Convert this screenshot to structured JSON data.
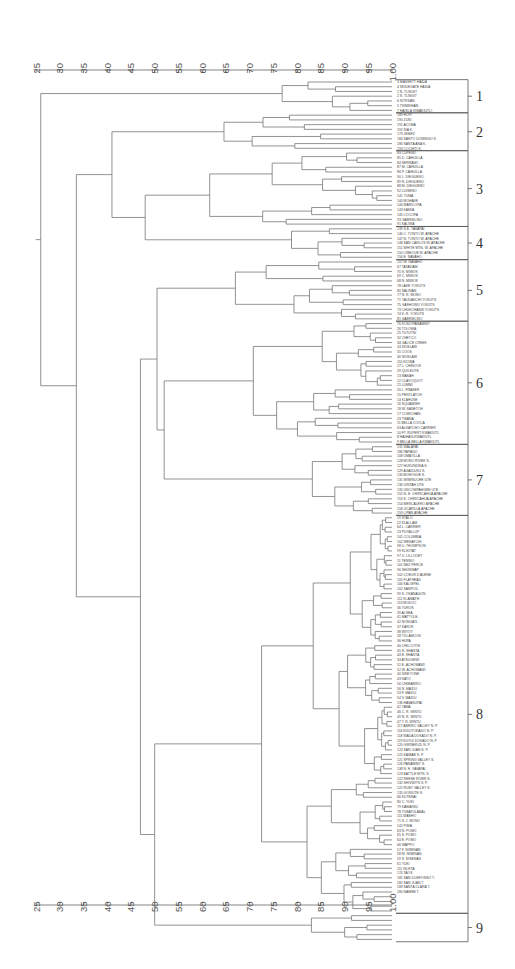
{
  "chart_data": {
    "type": "dendrogram",
    "orientation": "horizontal",
    "title": "",
    "xlabel": "",
    "ylabel": "",
    "axis": {
      "ticks": [
        25,
        30,
        35,
        40,
        45,
        50,
        55,
        60,
        65,
        70,
        75,
        80,
        85,
        90,
        95,
        100
      ],
      "tick_labels": [
        "25",
        "30",
        "35",
        "40",
        "45",
        "50",
        "55",
        "60",
        "65",
        "70",
        "75",
        "80",
        "85",
        "90",
        "95",
        "1.00"
      ],
      "range": [
        25,
        100
      ],
      "positions": [
        "top",
        "bottom"
      ]
    },
    "clusters": [
      {
        "id": "1",
        "label": "1",
        "leaf_range": [
          0,
          6
        ]
      },
      {
        "id": "2",
        "label": "2",
        "leaf_range": [
          7,
          14
        ]
      },
      {
        "id": "3",
        "label": "3",
        "leaf_range": [
          15,
          30
        ]
      },
      {
        "id": "4",
        "label": "4",
        "leaf_range": [
          31,
          37
        ]
      },
      {
        "id": "5",
        "label": "5",
        "leaf_range": [
          38,
          50
        ]
      },
      {
        "id": "6",
        "label": "6",
        "leaf_range": [
          51,
          76
        ]
      },
      {
        "id": "7",
        "label": "7",
        "leaf_range": [
          77,
          91
        ]
      },
      {
        "id": "8",
        "label": "8",
        "leaf_range": [
          92,
          175
        ]
      },
      {
        "id": "9",
        "label": "9",
        "leaf_range": [
          176,
          181
        ]
      }
    ],
    "leaves": [
      "3 MASSETT HAIDA",
      "4 SKIDEGATE HAIDA",
      "1 N. TLINGIT",
      "2 S. TLINGIT",
      "6 SITKSAN",
      "5 TSIMSHIAN",
      "7 HAISLA (KWAKIUTL)",
      "189 HOPI",
      "190 ZUNI",
      "191 ACOMA",
      "192 SIA K.",
      "173 JEMEZ",
      "184 SANTO DOMINGO K.",
      "186 SANTA ANA K.",
      "193 COCHITI K.",
      "83 CUPENO",
      "85 D. CAHUILLA",
      "84 SERRANO",
      "87 M. CAHUILLA",
      "86 P. CAHUILLA",
      "90 L. DIEGUENO",
      "89 N. DIEGUENO",
      "88 M. DIEGUENO",
      "92 LUISENO",
      "141 YUMA",
      "140 MOHAVE",
      "144 MARICOPA",
      "143 KAMIA",
      "145 COCOPA",
      "93 GABRIELINO",
      "91 KALIWA",
      "139 S.E. YAVAPAI",
      "146 C. TONTO W. APACHE",
      "147 N. TONTO W. APACHE",
      "148 SAN CARLOS W. APACHE",
      "151 WHITE MTN. W. APACHE",
      "150 CIBECUE W. APACHE",
      "156 E. NAVAHO",
      "157 W. NAVAHO",
      "67 TATAVIAM",
      "70 S. MIWOK",
      "69 C. MIWOK",
      "68 N. MIWOK",
      "78 LAKE YOKUTS",
      "80 SALINAN",
      "77 N. R. MONO",
      "71 YAUDANCHI YOKUTS",
      "75 GASHOWU YOKUTS",
      "73 CHUKCHANSI YOKUTS",
      "74 K. R. YOKUTS",
      "81 GABRIELINO",
      "76 KOSO/PANAMINT",
      "26 TOLOWA",
      "25 TUTUTNI",
      "32 CHETCO",
      "34 GALICE CREEK",
      "24 SIUSLAW",
      "31 COOS",
      "30 SIUSLAW",
      "110 KIOWA",
      "27 L. CHINOOK",
      "29 QUILEUTE",
      "13 MAKAH",
      "12 CLAYOQUOT",
      "21 LUMMI",
      "20 L. FRASER",
      "15 PENTLATCH",
      "14 KLAHUSE",
      "16 SQUAMISH",
      "18 W. SANETCH",
      "17 COWICHAN",
      "23 TWANA",
      "11 BELLA COOLA",
      "63 ALKATCHO CARRIER",
      "10 FT. RUPERT KWAKIUTL",
      "8 HAIHAIS KWAKIUTL",
      "9 BELLA BELLA KWAKIUTL",
      "131 WALAPAI",
      "186 PAPAGO",
      "108 UMATILLA",
      "128 MONO RIVER S.",
      "127 HUKUNDIKA S.",
      "129 AGAIDUKU S.",
      "130 BOHOGUE S.",
      "131 WIMINUCHE UTE",
      "136 UINTAH UTE",
      "135 UNCOMPAHGRE UTE",
      "152 N. E. CHIRICAHUA APACHE",
      "153 S. CHIRICAHUA APACHE",
      "154 MESCALERO APACHE",
      "158 JICARILLA APACHE",
      "159 LIPAN APACHE",
      "19 STALO",
      "22 KLALLAM",
      "64 L. CARRIER",
      "23 PUYALLUP",
      "101 COLUMBIA",
      "102 WENATCHI",
      "98 U. THOMPSON",
      "99 KLIKITAT",
      "97 U. LILLOOET",
      "11 TENINO",
      "101 NEZ PERCE",
      "96 SHUSWAP",
      "102 COEUR D'ALENE",
      "105 FLATHEAD",
      "106 KALISPEL",
      "102 SANPOIL",
      "99 S. OKANAGON",
      "112 KLAMATH",
      "113 MODOC",
      "36 YUROK",
      "39 ALSEA",
      "41 MATTOLE",
      "42 NONGATL",
      "37 KAROK",
      "38 WIYOT",
      "28 TILLAMOOK",
      "36 HUPA",
      "40 CHILCOTIN",
      "45 N. SHASTA",
      "44 E. SHASTA",
      "33 ATSUGEWI",
      "51 E. ACHOMAWI",
      "52 W. ACHOMAWI",
      "40 SINKYONE",
      "43 KATO",
      "56 CHIMARIKO",
      "56 N. MAIDU",
      "53 F. MAIDU",
      "54 V. MAIDU",
      "136 HAVASUPAI",
      "62 YANA",
      "46 C. R. WINTU",
      "49 N. R. WINTU",
      "47 T. R. WINTU",
      "117 AMERIC VALLEY N. P.",
      "116 KIDUTOKADO N. P.",
      "118 WADA DOKADO N. P.",
      "119 KUYUI DOKADO N. P.",
      "120 GWINEKUD N. P.",
      "124 SAN JUAN S. P.",
      "125 KAIBAB S. P.",
      "121 SPRING VALLEY S.",
      "126 PANAMINT S.",
      "138 N. E. YAVAPAI",
      "123 BATTLE MTN. S.",
      "122 REESE RIVER S.",
      "132 SHIVWITS S. P.",
      "122 RUBY VALLEY S.",
      "135 GOSIUTE S.",
      "66 KUTENAI",
      "80 C. YUKI",
      "79 KAWAIISU",
      "78 TUBATULABAL",
      "115 WASHO",
      "71 S. J. MONO",
      "142 PIMA",
      "63 N. POMO",
      "65 S. POMO",
      "64 E. POMO",
      "66 WAPPO",
      "57 F. NISENAN",
      "58 M. NISENAN",
      "59 S. NISENAN",
      "61 YUKI",
      "111 ISLETA",
      "170 TAOS",
      "181 SAN ILDEFONSO T.",
      "182 SAN JUAN T.",
      "183 SANTA CLARA T.",
      "180 NAMBE T."
    ],
    "merges_note": "Tree encoded as nested [left, right, similarity]; integers are leaf indices.",
    "tree": [
      [
        [
          [
            [
              [
                0,
                1,
                96
              ],
              [
                2,
                3,
                100
              ],
              82
            ],
            [
              [
                4,
                5,
                95
              ],
              6,
              73
            ],
            72
          ],
          6,
          65
        ],
        [
          [
            [
              [
                [
                  [
                    7,
                    8,
                    83
                  ],
                  9,
                  77
                ],
                [
                  [
                    [
                      10,
                      11,
                      78
                    ],
                    [
                      12,
                      [
                        13,
                        14,
                        90
                      ],
                      86
                    ],
                    79
                  ],
                  0,
                  0
                ],
                60
              ],
              [
                [
                  [
                    [
                      [
                        15,
                        [
                          16,
                          17,
                          84
                        ],
                        83
                      ],
                      [
                        [
                          18,
                          19,
                          88
                        ],
                        [
                          20,
                          [
                            21,
                            22,
                            95
                          ],
                          93
                        ],
                        0
                      ],
                      0
                    ],
                    [
                      [
                        23,
                        24,
                        80
                      ],
                      [
                        [
                          25,
                          [
                            26,
                            27,
                            84
                          ],
                          81
                        ],
                        [
                          28,
                          [
                            29,
                            30,
                            95
                          ],
                          74
                        ],
                        0
                      ],
                      0
                    ],
                    0
                  ],
                  [
                    [
                      [
                        31,
                        [
                          32,
                          33,
                          92
                        ],
                        91
                      ],
                      [
                        [
                          34,
                          35,
                          96
                        ],
                        36,
                        88
                      ],
                      0
                    ],
                    37,
                    71
                  ],
                  0
                ],
                0,
                0
              ],
              0
            ],
            0,
            0
          ],
          0,
          0
        ],
        0
      ]
    ],
    "major_merges": [
      {
        "level": 26.0,
        "note": "root"
      },
      {
        "level": 33.5,
        "note": "clusters 2-9 join"
      },
      {
        "level": 41.0,
        "note": "clusters 2-4 join"
      },
      {
        "level": 48.0,
        "note": "clusters 3-4"
      },
      {
        "level": 49.5,
        "note": "clusters 5-9"
      },
      {
        "level": 50.0,
        "note": "cluster 8 with cluster 9"
      },
      {
        "level": 52.0,
        "note": "clusters 5-6-7"
      },
      {
        "level": 64.6,
        "note": "cluster 1 internal root"
      }
    ]
  }
}
